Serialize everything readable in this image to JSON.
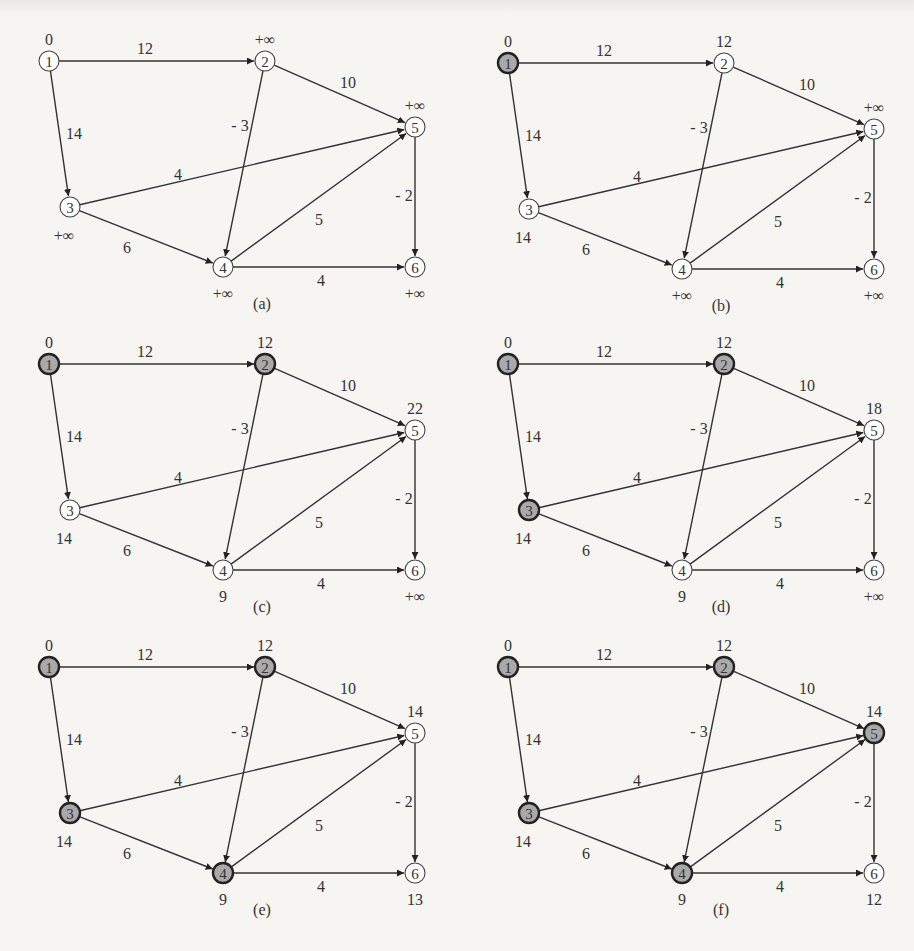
{
  "figure": {
    "colors": {
      "background": "#f6f5f2",
      "visited_fill": "#a9a9a9",
      "unvisited_fill": "#ffffff",
      "stroke": "#333333"
    },
    "graph": {
      "nodes": [
        {
          "id": "1",
          "x": 49,
          "y": 61
        },
        {
          "id": "2",
          "x": 265,
          "y": 61
        },
        {
          "id": "3",
          "x": 70,
          "y": 207
        },
        {
          "id": "4",
          "x": 223,
          "y": 267
        },
        {
          "id": "5",
          "x": 415,
          "y": 127
        },
        {
          "id": "6",
          "x": 415,
          "y": 267
        }
      ],
      "edges": [
        {
          "from": "1",
          "to": "2",
          "weight": "12",
          "lx": 145,
          "ly": 54
        },
        {
          "from": "1",
          "to": "3",
          "weight": "14",
          "lx": 74,
          "ly": 139
        },
        {
          "from": "2",
          "to": "5",
          "weight": "10",
          "lx": 348,
          "ly": 88
        },
        {
          "from": "2",
          "to": "4",
          "weight": "- 3",
          "lx": 240,
          "ly": 131
        },
        {
          "from": "3",
          "to": "5",
          "weight": "4",
          "lx": 178,
          "ly": 180
        },
        {
          "from": "3",
          "to": "4",
          "weight": "6",
          "lx": 127,
          "ly": 253
        },
        {
          "from": "4",
          "to": "5",
          "weight": "5",
          "lx": 319,
          "ly": 225
        },
        {
          "from": "4",
          "to": "6",
          "weight": "4",
          "lx": 321,
          "ly": 286
        },
        {
          "from": "5",
          "to": "6",
          "weight": "- 2",
          "lx": 404,
          "ly": 201
        }
      ]
    },
    "panels": [
      {
        "caption": "(a)",
        "visited": [],
        "distances": {
          "1": "0",
          "2": "+∞",
          "3": "+∞",
          "4": "+∞",
          "5": "+∞",
          "6": "+∞"
        }
      },
      {
        "caption": "(b)",
        "visited": [
          "1"
        ],
        "distances": {
          "1": "0",
          "2": "12",
          "3": "14",
          "4": "+∞",
          "5": "+∞",
          "6": "+∞"
        }
      },
      {
        "caption": "(c)",
        "visited": [
          "1",
          "2"
        ],
        "distances": {
          "1": "0",
          "2": "12",
          "3": "14",
          "4": "9",
          "5": "22",
          "6": "+∞"
        }
      },
      {
        "caption": "(d)",
        "visited": [
          "1",
          "2",
          "3"
        ],
        "distances": {
          "1": "0",
          "2": "12",
          "3": "14",
          "4": "9",
          "5": "18",
          "6": "+∞"
        }
      },
      {
        "caption": "(e)",
        "visited": [
          "1",
          "2",
          "3",
          "4"
        ],
        "distances": {
          "1": "0",
          "2": "12",
          "3": "14",
          "4": "9",
          "5": "14",
          "6": "13"
        }
      },
      {
        "caption": "(f)",
        "visited": [
          "1",
          "2",
          "3",
          "4",
          "5"
        ],
        "distances": {
          "1": "0",
          "2": "12",
          "3": "14",
          "4": "9",
          "5": "14",
          "6": "12"
        }
      }
    ]
  }
}
